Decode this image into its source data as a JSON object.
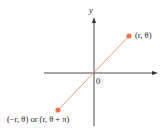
{
  "diagram": {
    "axes": {
      "y_label": "y",
      "origin_label": "0",
      "axis_color": "#4a4a4a"
    },
    "points": [
      {
        "label": "(r, θ)",
        "color": "#e8764e"
      },
      {
        "label": "(−r, θ) or (r, θ + π)",
        "color": "#e8764e"
      }
    ],
    "line_color": "#ec9a7c"
  }
}
